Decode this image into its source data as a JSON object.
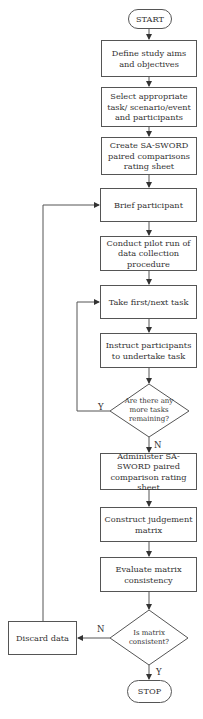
{
  "flowchart": {
    "start": "START",
    "stop": "STOP",
    "steps": [
      "Define study aims and objectives",
      "Select appropriate task/ scenario/event and participants",
      "Create SA-SWORD paired comparisons rating sheet",
      "Brief participant",
      "Conduct pilot run of data collection procedure",
      "Take first/next task",
      "Instruct participants to undertake task",
      "Administer SA-SWORD paired comparison rating sheet",
      "Construct judgement matrix",
      "Evaluate matrix consistency"
    ],
    "decisions": [
      {
        "question": "Are there any more tasks remaining?",
        "yes": "Y",
        "no": "N"
      },
      {
        "question": "Is matrix consistent?",
        "yes": "Y",
        "no": "N"
      }
    ],
    "discard": "Discard data"
  }
}
